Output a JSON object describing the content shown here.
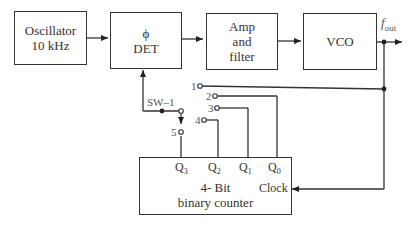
{
  "blocks": {
    "oscillator": {
      "line1": "Oscillator",
      "line2": "10 kHz"
    },
    "phase_det": {
      "line1": "ϕ",
      "line2": "DET"
    },
    "amp_filter": {
      "line1": "Amp",
      "line2": "and",
      "line3": "filter"
    },
    "vco": {
      "line1": "VCO"
    },
    "counter": {
      "line1": "4- Bit",
      "line2": "binary counter",
      "clock": "Clock"
    }
  },
  "outputs": {
    "counter_q": [
      "Q",
      "Q",
      "Q",
      "Q"
    ],
    "counter_q_sub": [
      "3",
      "2",
      "1",
      "0"
    ]
  },
  "fout": {
    "f": "f",
    "sub": "out"
  },
  "switch": {
    "label": "SW–1",
    "positions": [
      "1",
      "2",
      "3",
      "4",
      "5"
    ]
  }
}
